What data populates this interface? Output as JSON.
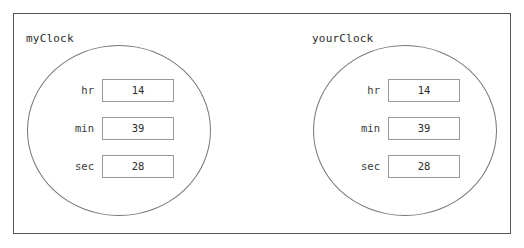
{
  "panel": {
    "groups": [
      {
        "title": "myClock",
        "fields": [
          {
            "label": "hr",
            "value": "14"
          },
          {
            "label": "min",
            "value": "39"
          },
          {
            "label": "sec",
            "value": "28"
          }
        ]
      },
      {
        "title": "yourClock",
        "fields": [
          {
            "label": "hr",
            "value": "14"
          },
          {
            "label": "min",
            "value": "39"
          },
          {
            "label": "sec",
            "value": "28"
          }
        ]
      }
    ]
  },
  "colors": {
    "frame_border": "#555555",
    "circle_border": "#777777",
    "field_border": "#9a9a9a",
    "text": "#2b2b2b",
    "background": "#ffffff"
  }
}
